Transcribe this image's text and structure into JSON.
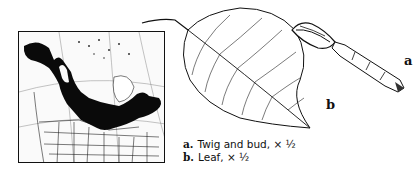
{
  "figure": {
    "map": {
      "description": "Range map of North America showing species distribution in black"
    },
    "labels": {
      "twig": "a",
      "leaf": "b"
    },
    "caption": [
      {
        "key": "a.",
        "text": "Twig and bud, × ½"
      },
      {
        "key": "b.",
        "text": "Leaf, × ½"
      }
    ]
  }
}
